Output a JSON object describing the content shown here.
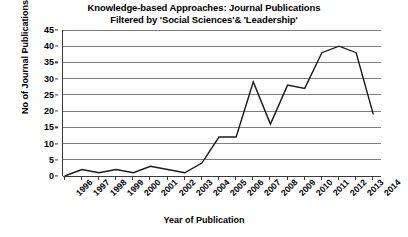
{
  "chart_data": {
    "type": "line",
    "title": "Knowledge-based Approaches: Journal Publications",
    "subtitle": "Filtered by 'Social Sciences'& 'Leadership'",
    "xlabel": "Year of Publication",
    "ylabel": "No of Journal Publications",
    "categories": [
      "1996",
      "1997",
      "1998",
      "1999",
      "2000",
      "2001",
      "2002",
      "2003",
      "2004",
      "2005",
      "2006",
      "2007",
      "2008",
      "2009",
      "2010",
      "2011",
      "2012",
      "2013",
      "2014"
    ],
    "values": [
      0,
      2,
      1,
      2,
      1,
      3,
      2,
      1,
      4,
      12,
      12,
      29,
      16,
      28,
      27,
      38,
      40,
      38,
      19
    ],
    "series": [
      {
        "name": "No of Journal Publications",
        "values": [
          0,
          2,
          1,
          2,
          1,
          3,
          2,
          1,
          4,
          12,
          12,
          29,
          16,
          28,
          27,
          38,
          40,
          38,
          19
        ]
      }
    ],
    "ylim": [
      0,
      45
    ],
    "yticks": [
      0,
      5,
      10,
      15,
      20,
      25,
      30,
      35,
      40,
      45
    ],
    "ytick_labels": [
      "0",
      "5",
      "10",
      "15",
      "20",
      "25",
      "30",
      "35",
      "40",
      "45"
    ],
    "grid": true,
    "legend": false,
    "line_color": "#1a1a1a",
    "grid_color": "#7d7d7d",
    "axis_color": "#3a3a3a",
    "background": "#ffffff"
  }
}
